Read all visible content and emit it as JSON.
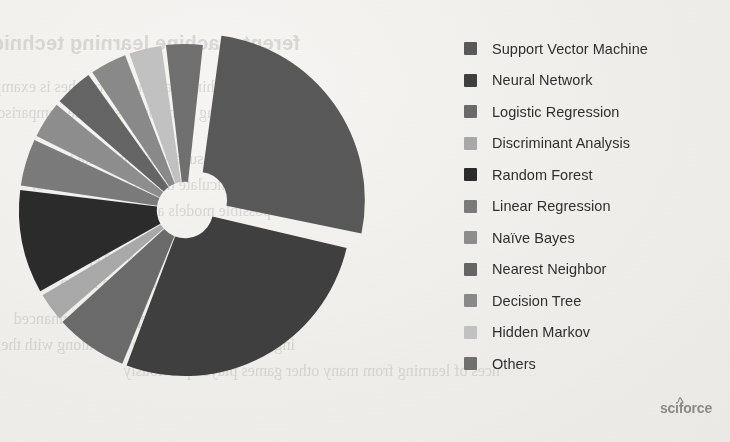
{
  "document": {
    "watermark": "sciforce",
    "watermark_caret": "^",
    "bleed_through": {
      "heading": "ferent machine learning techniques",
      "lines": [
        "different machine learning approaches is examples",
        "the learning is the process of the comparison",
        "analysis of the supervised and data to the",
        "we may calculate the accuracy, posterior",
        "The possible models are able to the",
        "labels will also be with state approaches",
        "may be the individual that data has to",
        "but it will be the most dependency-enhanced",
        "ing, on the blind agent develop along with the",
        "nces of learning from many other games played previously"
      ]
    }
  },
  "chart_data": {
    "type": "pie",
    "variant": "donut",
    "title": "",
    "hole_ratio": 0.17,
    "exploded_slice_index": 0,
    "start_angle_deg": 7,
    "direction": "clockwise",
    "legend_position": "right",
    "categories": [
      "Support Vector Machine",
      "Neural Network",
      "Logistic Regression",
      "Discriminant Analysis",
      "Random Forest",
      "Linear Regression",
      "Naïve Bayes",
      "Nearest Neighbor",
      "Decision Tree",
      "Hidden Markov",
      "Others"
    ],
    "values": [
      26.5,
      27.5,
      7.5,
      3.2,
      10.5,
      5.0,
      4.0,
      4.2,
      4.0,
      3.6,
      4.0
    ],
    "colors": [
      "#595959",
      "#3f3f3f",
      "#6b6b6b",
      "#a9a9a9",
      "#2b2b2b",
      "#7b7b7b",
      "#8e8e8e",
      "#656565",
      "#8a8a8a",
      "#c2c2c2",
      "#707070"
    ],
    "gap_color": "#f2f1ed",
    "gap_deg": 1.6
  },
  "legend": {
    "items": [
      {
        "label": "Support Vector Machine",
        "color": "#595959"
      },
      {
        "label": "Neural Network",
        "color": "#3f3f3f"
      },
      {
        "label": "Logistic Regression",
        "color": "#6b6b6b"
      },
      {
        "label": "Discriminant Analysis",
        "color": "#a9a9a9"
      },
      {
        "label": "Random Forest",
        "color": "#2b2b2b"
      },
      {
        "label": "Linear Regression",
        "color": "#7b7b7b"
      },
      {
        "label": "Naïve Bayes",
        "color": "#8e8e8e"
      },
      {
        "label": "Nearest Neighbor",
        "color": "#656565"
      },
      {
        "label": "Decision Tree",
        "color": "#8a8a8a"
      },
      {
        "label": "Hidden Markov",
        "color": "#c2c2c2"
      },
      {
        "label": "Others",
        "color": "#707070"
      }
    ]
  }
}
